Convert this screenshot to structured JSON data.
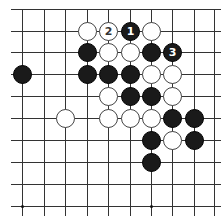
{
  "board": {
    "columns_x": [
      22,
      44,
      65,
      87,
      108,
      130,
      151,
      172,
      194,
      214
    ],
    "rows_y": [
      9,
      31,
      52,
      74,
      96,
      118,
      140,
      162,
      184,
      206
    ],
    "line_color": "#333333",
    "top_edge": true,
    "star_points": [
      [
        0,
        9
      ],
      [
        6,
        9
      ]
    ],
    "stones": [
      {
        "row": 1,
        "col": 3,
        "color": "white",
        "label": ""
      },
      {
        "row": 1,
        "col": 4,
        "color": "white",
        "label": "2"
      },
      {
        "row": 1,
        "col": 5,
        "color": "black",
        "label": "1"
      },
      {
        "row": 1,
        "col": 6,
        "color": "white",
        "label": ""
      },
      {
        "row": 2,
        "col": 3,
        "color": "black",
        "label": ""
      },
      {
        "row": 2,
        "col": 4,
        "color": "white",
        "label": ""
      },
      {
        "row": 2,
        "col": 5,
        "color": "white",
        "label": ""
      },
      {
        "row": 2,
        "col": 6,
        "color": "black",
        "label": ""
      },
      {
        "row": 2,
        "col": 7,
        "color": "black",
        "label": "3"
      },
      {
        "row": 3,
        "col": 0,
        "color": "black",
        "label": ""
      },
      {
        "row": 3,
        "col": 3,
        "color": "black",
        "label": ""
      },
      {
        "row": 3,
        "col": 4,
        "color": "black",
        "label": ""
      },
      {
        "row": 3,
        "col": 5,
        "color": "black",
        "label": ""
      },
      {
        "row": 3,
        "col": 6,
        "color": "white",
        "label": ""
      },
      {
        "row": 3,
        "col": 7,
        "color": "white",
        "label": ""
      },
      {
        "row": 4,
        "col": 4,
        "color": "white",
        "label": ""
      },
      {
        "row": 4,
        "col": 5,
        "color": "black",
        "label": ""
      },
      {
        "row": 4,
        "col": 6,
        "color": "black",
        "label": ""
      },
      {
        "row": 4,
        "col": 7,
        "color": "white",
        "label": ""
      },
      {
        "row": 5,
        "col": 2,
        "color": "white",
        "label": ""
      },
      {
        "row": 5,
        "col": 4,
        "color": "white",
        "label": ""
      },
      {
        "row": 5,
        "col": 5,
        "color": "white",
        "label": ""
      },
      {
        "row": 5,
        "col": 6,
        "color": "white",
        "label": ""
      },
      {
        "row": 5,
        "col": 7,
        "color": "black",
        "label": ""
      },
      {
        "row": 5,
        "col": 8,
        "color": "black",
        "label": ""
      },
      {
        "row": 6,
        "col": 6,
        "color": "black",
        "label": ""
      },
      {
        "row": 6,
        "col": 7,
        "color": "white",
        "label": ""
      },
      {
        "row": 6,
        "col": 8,
        "color": "black",
        "label": ""
      },
      {
        "row": 7,
        "col": 6,
        "color": "black",
        "label": ""
      }
    ]
  }
}
